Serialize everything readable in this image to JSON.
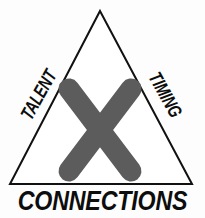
{
  "diagram": {
    "type": "triangle-venn",
    "background_color": "#fdfdfd",
    "outline_color": "#111111",
    "center_mark_color": "#5c5c5c",
    "label_color": "#0d0d0d",
    "triangle": {
      "apex": [
        100,
        11
      ],
      "bottom_left": [
        10,
        184
      ],
      "bottom_right": [
        192,
        184
      ],
      "stroke_width": 2
    },
    "center_mark": {
      "name": "x-mark",
      "shape": "X",
      "stroke_width": 21,
      "arm_endpoints": [
        [
          69,
          89,
          131,
          171
        ],
        [
          131,
          89,
          69,
          171
        ]
      ]
    },
    "labels": {
      "left": "TALENT",
      "right": "TIMING",
      "bottom": "CONNECTIONS"
    }
  }
}
